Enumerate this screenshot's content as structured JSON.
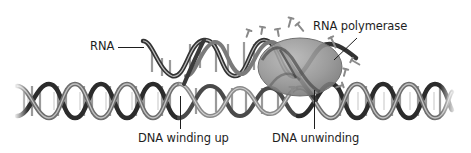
{
  "diagram": {
    "labels": {
      "rna": "RNA",
      "rna_polymerase": "RNA polymerase",
      "dna_winding_up": "DNA winding up",
      "dna_unwinding": "DNA unwinding"
    },
    "colors": {
      "background": "#ffffff",
      "text": "#1e1e1e",
      "leader_line": "#1e1e1e",
      "helix_dark": "#2a2a2a",
      "helix_mid": "#7a7a7a",
      "helix_light": "#c8c8c8",
      "polymerase_fill": "#8f8f8f",
      "polymerase_edge": "#6a6a6a",
      "nucleotide": "#8a8a8a"
    },
    "components": [
      {
        "name": "lower-dna-double-helix",
        "x_range": [
          17,
          452
        ],
        "y_range": [
          82,
          120
        ]
      },
      {
        "name": "upper-rna-strand-helix",
        "x_range": [
          130,
          362
        ],
        "y_range": [
          37,
          80
        ]
      },
      {
        "name": "rna-polymerase-enzyme",
        "shape": "ellipse",
        "center": [
          300,
          67
        ],
        "radii": [
          42,
          29
        ]
      },
      {
        "name": "free-nucleotides",
        "count": 10
      }
    ]
  }
}
